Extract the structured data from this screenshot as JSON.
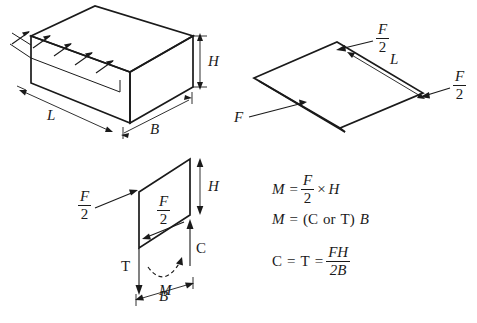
{
  "figure": {
    "background_color": "#ffffff",
    "ink_color": "#1a1a1a"
  },
  "panels": {
    "block_3d": {
      "name": "isometric block with distributed shear arrows",
      "labels": {
        "height": "H",
        "length": "L",
        "breadth": "B"
      },
      "shear_arrow_count": 5
    },
    "plan_view": {
      "name": "plan view parallelogram with applied forces",
      "labels": {
        "force_top_num": "F",
        "force_top_den": "2",
        "force_right_num": "F",
        "force_right_den": "2",
        "force_bottom": "F",
        "length": "L"
      }
    },
    "free_body": {
      "name": "free body diagram of end face",
      "labels": {
        "force_left_num": "F",
        "force_left_den": "2",
        "force_inner_num": "F",
        "force_inner_den": "2",
        "height": "H",
        "tension": "T",
        "compression": "C",
        "moment": "M",
        "breadth": "B"
      }
    }
  },
  "equations": [
    {
      "id": "moment-from-force",
      "lhs": "M",
      "rel": "=",
      "num": "F",
      "den": "2",
      "op": "×",
      "rhs": "H"
    },
    {
      "id": "moment-from-couple",
      "lhs": "M",
      "rel": "=",
      "open": "(",
      "c": "C",
      "orword": "or",
      "t": "T",
      "close": ")",
      "rhs": "B"
    },
    {
      "id": "couple-force-value",
      "lhs": "C",
      "rel1": "=",
      "mid": "T",
      "rel2": "=",
      "num": "FH",
      "den": "2B"
    }
  ]
}
